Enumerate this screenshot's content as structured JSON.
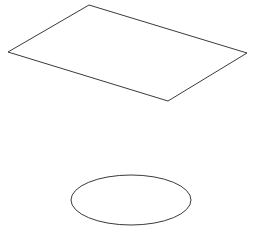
{
  "canvas": {
    "width": 254,
    "height": 235,
    "background_color": "#ffffff",
    "stroke_color": "#3a3a3a",
    "stroke_width": 1
  },
  "figure": {
    "shape_count": 2,
    "shapes": [
      {
        "name": "perspective-rectangle",
        "type": "polygon",
        "label": "",
        "fill": "none",
        "stroke_color": "#3a3a3a",
        "points": "89,5 247,53 168,101 8,52",
        "vertices": [
          {
            "id": "top",
            "x": 89,
            "y": 5
          },
          {
            "id": "right",
            "x": 247,
            "y": 53
          },
          {
            "id": "bottom",
            "x": 168,
            "y": 101
          },
          {
            "id": "left",
            "x": 8,
            "y": 52
          }
        ]
      },
      {
        "name": "ellipse",
        "type": "ellipse",
        "label": "",
        "fill": "none",
        "stroke_color": "#3a3a3a",
        "center_x": 131,
        "center_y": 200,
        "radius_x": 60,
        "radius_y": 25
      }
    ]
  }
}
